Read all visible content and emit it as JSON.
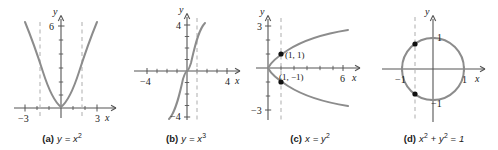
{
  "figure": {
    "background": "#ffffff",
    "curve_color": "#8c8c8c",
    "axis_color": "#555555",
    "dash_color": "#b5b5b5",
    "point_color": "#111111",
    "text_color": "#1a1a1a"
  },
  "panels": [
    {
      "id": "a",
      "tag": "(a)",
      "equation_html": "y = x<sup>2</sup>",
      "equation_text": "y = x^2",
      "axis_labels": {
        "x": "x",
        "y": "y"
      },
      "x_ticks": [
        "-3",
        "3"
      ],
      "y_ticks": [
        "6"
      ],
      "dashed_lines": [
        "x = -1.4",
        "x = 1.4"
      ],
      "points": [],
      "point_labels": []
    },
    {
      "id": "b",
      "tag": "(b)",
      "equation_html": "y = x<sup>3</sup>",
      "equation_text": "y = x^3",
      "axis_labels": {
        "x": "x",
        "y": "y"
      },
      "x_ticks": [
        "-4",
        "4"
      ],
      "y_ticks": [
        "4",
        "-4"
      ],
      "dashed_lines": [
        "x = 1"
      ],
      "points": [],
      "point_labels": []
    },
    {
      "id": "c",
      "tag": "(c)",
      "equation_html": "x = y<sup>2</sup>",
      "equation_text": "x = y^2",
      "axis_labels": {
        "x": "x",
        "y": "y"
      },
      "x_ticks": [
        "6"
      ],
      "y_ticks": [
        "3",
        "-3"
      ],
      "dashed_lines": [
        "x = 1"
      ],
      "points": [
        "(1, 1)",
        "(1, -1)"
      ],
      "point_labels": [
        "(1, 1)",
        "(1, −1)"
      ]
    },
    {
      "id": "d",
      "tag": "(d)",
      "equation_html": "x<sup>2</sup> <span class=\"op\">+</span> y<sup>2</sup> <span class=\"op\">=</span> 1",
      "equation_text": "x^2 + y^2 = 1",
      "axis_labels": {
        "x": "x",
        "y": "y"
      },
      "x_ticks": [
        "-1",
        "1"
      ],
      "y_ticks": [
        "1",
        "-1"
      ],
      "dashed_lines": [
        "x = -0.6"
      ],
      "points": [
        "(-0.6, 0.8)",
        "(-0.6, -0.8)"
      ],
      "point_labels": []
    }
  ],
  "chart_data": [
    {
      "type": "line",
      "panel": "a",
      "title": "(a) y = x^2",
      "function": "y = x^2",
      "xlabel": "x",
      "ylabel": "y",
      "xlim": [
        -3.4,
        3.4
      ],
      "ylim": [
        -1.2,
        7.0
      ],
      "xticks": [
        -3,
        3
      ],
      "yticks": [
        6
      ],
      "grid": false,
      "legend": "none",
      "x": [
        -2.6,
        -2.2,
        -1.8,
        -1.4,
        -1.0,
        -0.6,
        -0.2,
        0,
        0.2,
        0.6,
        1.0,
        1.4,
        1.8,
        2.2,
        2.6
      ],
      "y": [
        6.76,
        4.84,
        3.24,
        1.96,
        1.0,
        0.36,
        0.04,
        0,
        0.04,
        0.36,
        1.0,
        1.96,
        3.24,
        4.84,
        6.76
      ],
      "annotations": [
        "vertical dashed line at x = -1.4",
        "vertical dashed line at x = 1.4"
      ]
    },
    {
      "type": "line",
      "panel": "b",
      "title": "(b) y = x^3",
      "function": "y = x^3",
      "xlabel": "x",
      "ylabel": "y",
      "xlim": [
        -4.8,
        4.8
      ],
      "ylim": [
        -5.6,
        5.6
      ],
      "xticks": [
        -4,
        4
      ],
      "yticks": [
        -4,
        4
      ],
      "grid": false,
      "legend": "none",
      "x": [
        -1.7,
        -1.5,
        -1.2,
        -0.9,
        -0.6,
        -0.3,
        0,
        0.3,
        0.6,
        0.9,
        1.2,
        1.5,
        1.7
      ],
      "y": [
        -4.91,
        -3.38,
        -1.73,
        -0.73,
        -0.22,
        -0.03,
        0,
        0.03,
        0.22,
        0.73,
        1.73,
        3.38,
        4.91
      ],
      "annotations": [
        "vertical dashed line at x = 1"
      ]
    },
    {
      "type": "line",
      "panel": "c",
      "title": "(c) x = y^2",
      "function": "x = y^2",
      "xlabel": "x",
      "ylabel": "y",
      "xlim": [
        -1.2,
        7.6
      ],
      "ylim": [
        -3.6,
        3.6
      ],
      "xticks": [
        6
      ],
      "yticks": [
        -3,
        3
      ],
      "grid": false,
      "legend": "none",
      "y": [
        -2.6,
        -2.2,
        -1.8,
        -1.4,
        -1.0,
        -0.6,
        -0.2,
        0,
        0.2,
        0.6,
        1.0,
        1.4,
        1.8,
        2.2,
        2.6
      ],
      "x": [
        6.76,
        4.84,
        3.24,
        1.96,
        1.0,
        0.36,
        0.04,
        0,
        0.04,
        0.36,
        1.0,
        1.96,
        3.24,
        4.84,
        6.76
      ],
      "points": [
        {
          "x": 1,
          "y": 1,
          "label": "(1, 1)"
        },
        {
          "x": 1,
          "y": -1,
          "label": "(1, −1)"
        }
      ],
      "annotations": [
        "vertical dashed line at x = 1 meets curve twice"
      ]
    },
    {
      "type": "line",
      "panel": "d",
      "title": "(d) x^2 + y^2 = 1",
      "function": "x^2 + y^2 = 1",
      "xlabel": "x",
      "ylabel": "y",
      "xlim": [
        -1.7,
        1.7
      ],
      "ylim": [
        -1.7,
        1.7
      ],
      "xticks": [
        -1,
        1
      ],
      "yticks": [
        -1,
        1
      ],
      "grid": false,
      "legend": "none",
      "shape": "circle",
      "center": [
        0,
        0
      ],
      "radius": 1,
      "points": [
        {
          "x": -0.6,
          "y": 0.8
        },
        {
          "x": -0.6,
          "y": -0.8
        }
      ],
      "annotations": [
        "vertical dashed line at x = -0.6 meets circle twice"
      ]
    }
  ]
}
